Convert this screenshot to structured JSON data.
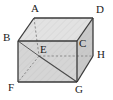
{
  "figure": {
    "name": "rectangular-box-diagram",
    "type": "geometry-solid",
    "shape": "cuboid",
    "colors": {
      "background": "#ffffff",
      "face_fill": "#d9d9d9",
      "face_fill_light": "#e4e4e4",
      "face_fill_dark": "#cccccc",
      "edge_visible": "#3a3a3a",
      "edge_hidden": "#8a8a8a",
      "diagonal": "#4a4a4a",
      "label_color": "#1a1a1a"
    },
    "vertices": [
      {
        "id": "A",
        "label": "A",
        "x": 34,
        "y": 18,
        "hidden": false,
        "label_x": 31,
        "label_y": 3
      },
      {
        "id": "D",
        "label": "D",
        "x": 93,
        "y": 18,
        "hidden": false,
        "label_x": 96,
        "label_y": 4
      },
      {
        "id": "B",
        "label": "B",
        "x": 18,
        "y": 41,
        "hidden": false,
        "label_x": 3,
        "label_y": 32
      },
      {
        "id": "C",
        "label": "C",
        "x": 77,
        "y": 41,
        "hidden": false,
        "label_x": 79,
        "label_y": 38
      },
      {
        "id": "E",
        "label": "E",
        "x": 39,
        "y": 56,
        "hidden": true,
        "label_x": 40,
        "label_y": 44
      },
      {
        "id": "H",
        "label": "H",
        "x": 93,
        "y": 56,
        "hidden": false,
        "label_x": 97,
        "label_y": 49
      },
      {
        "id": "F",
        "label": "F",
        "x": 18,
        "y": 82,
        "hidden": false,
        "label_x": 8,
        "label_y": 82
      },
      {
        "id": "G",
        "label": "G",
        "x": 77,
        "y": 82,
        "hidden": false,
        "label_x": 75,
        "label_y": 84
      }
    ],
    "edges": [
      {
        "id": "A-D",
        "from": "A",
        "to": "D",
        "style": "solid"
      },
      {
        "id": "A-B",
        "from": "A",
        "to": "B",
        "style": "solid"
      },
      {
        "id": "D-C",
        "from": "D",
        "to": "C",
        "style": "solid"
      },
      {
        "id": "D-H",
        "from": "D",
        "to": "H",
        "style": "solid"
      },
      {
        "id": "B-C",
        "from": "B",
        "to": "C",
        "style": "solid"
      },
      {
        "id": "B-F",
        "from": "B",
        "to": "F",
        "style": "solid"
      },
      {
        "id": "C-G",
        "from": "C",
        "to": "G",
        "style": "solid"
      },
      {
        "id": "F-G",
        "from": "F",
        "to": "G",
        "style": "solid"
      },
      {
        "id": "G-H",
        "from": "G",
        "to": "H",
        "style": "solid"
      },
      {
        "id": "A-E",
        "from": "A",
        "to": "E",
        "style": "dashed"
      },
      {
        "id": "E-F",
        "from": "E",
        "to": "F",
        "style": "dashed"
      },
      {
        "id": "E-H",
        "from": "E",
        "to": "H",
        "style": "dashed"
      }
    ],
    "diagonals": [
      {
        "id": "B-E",
        "from": "B",
        "to": "E",
        "style": "solid"
      },
      {
        "id": "E-G",
        "from": "E",
        "to": "G",
        "style": "solid"
      }
    ]
  }
}
